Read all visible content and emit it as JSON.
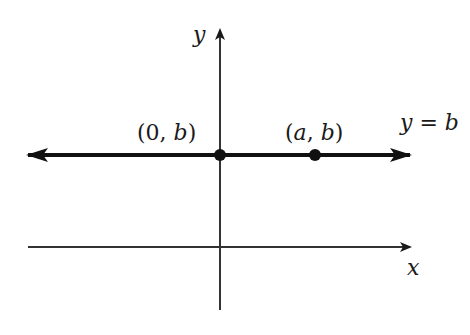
{
  "diagram": {
    "axes": {
      "x_label": "x",
      "y_label": "y"
    },
    "line": {
      "equation_label": "y = b",
      "equation_parts": {
        "lhs": "y",
        "eq": " = ",
        "rhs": "b"
      }
    },
    "points": [
      {
        "label": "(0, b)",
        "open": "(",
        "x": "0",
        "sep": ", ",
        "y": "b",
        "close": ")"
      },
      {
        "label": "(a, b)",
        "open": "(",
        "x": "a",
        "sep": ", ",
        "y": "b",
        "close": ")"
      }
    ],
    "colors": {
      "ink": "#1a1a1a",
      "axis": "#333333",
      "background": "#ffffff"
    }
  }
}
